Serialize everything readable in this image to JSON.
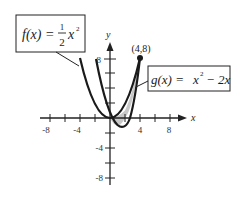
{
  "diagram": {
    "type": "function-graph",
    "axes": {
      "x_label": "x",
      "y_label": "y",
      "x_ticks": [
        {
          "value": -8,
          "label": "-8"
        },
        {
          "value": -4,
          "label": "-4"
        },
        {
          "value": 4,
          "label": "4"
        },
        {
          "value": 8,
          "label": "8"
        }
      ],
      "y_ticks": [
        {
          "value": 8,
          "label": "8"
        },
        {
          "value": -4,
          "label": "-4"
        },
        {
          "value": -8,
          "label": "-8"
        }
      ]
    },
    "functions": [
      {
        "name": "f",
        "label_lhs": "f(x) =",
        "label_frac_num": "1",
        "label_frac_den": "2",
        "label_rhs": "x",
        "label_exp": "2",
        "expression": "(1/2)x^2"
      },
      {
        "name": "g",
        "label_lhs": "g(x) =",
        "label_rhs": "x",
        "label_exp": "2",
        "label_tail": "− 2x",
        "expression": "x^2 - 2x"
      }
    ],
    "point": {
      "label": "(4,8)",
      "x": 4,
      "y": 8
    },
    "shaded_region": "area between f and g from x=0 to x=4",
    "colors": {
      "curve": "#1a1a1a",
      "shade": "#c8c8c8",
      "axis": "#222222"
    }
  }
}
